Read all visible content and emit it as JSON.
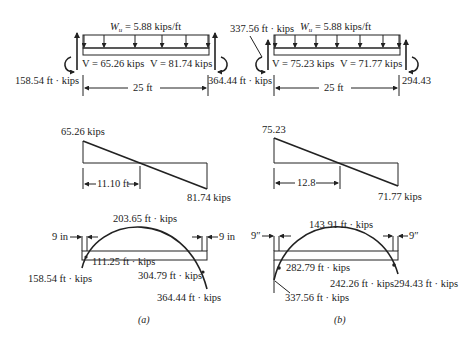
{
  "figure": {
    "panels": [
      {
        "id": "a",
        "caption": "(a)",
        "beam": {
          "load_label_w": "W",
          "load_label_sub": "u",
          "load_label_rest": " = 5.88 kips/ft",
          "shear_left_label": "V = 65.26 kips",
          "shear_right_label": "V = 81.74 kips",
          "moment_left_label": "158.54 ft · kips",
          "moment_right_label": "364.44 ft · kips",
          "span_label": "25 ft"
        },
        "shear_diagram": {
          "max_label": "65.26 kips",
          "min_label": "81.74 kips",
          "zero_distance_label": "11.10 ft"
        },
        "moment_diagram": {
          "peak_label": "203.65 ft · kips",
          "left_offset_label": "9 in",
          "right_offset_label": "9 in",
          "left_face_label": "111.25 ft · kips",
          "left_end_label": "158.54 ft · kips",
          "right_face_label": "304.79 ft · kips",
          "right_end_label": "364.44 ft · kips"
        }
      },
      {
        "id": "b",
        "caption": "(b)",
        "beam": {
          "load_label_w": "W",
          "load_label_sub": "u",
          "load_label_rest": " = 5.88 kips/ft",
          "shear_left_label": "V = 75.23 kips",
          "shear_right_label": "V = 71.77 kips",
          "moment_left_label": "337.56 ft · kips",
          "moment_right_label": "294.43",
          "span_label": "25 ft"
        },
        "shear_diagram": {
          "max_label": "75.23",
          "min_label": "71.77 kips",
          "zero_distance_label": "12.8"
        },
        "moment_diagram": {
          "peak_label": "143.91 ft · kips",
          "left_offset_label": "9″",
          "right_offset_label": "9″",
          "left_face_label": "282.79 ft · kips",
          "left_end_label": "337.56 ft · kips",
          "right_face_label": "242.26 ft · kips",
          "right_end_label": "294.43 ft · kips"
        }
      }
    ]
  }
}
